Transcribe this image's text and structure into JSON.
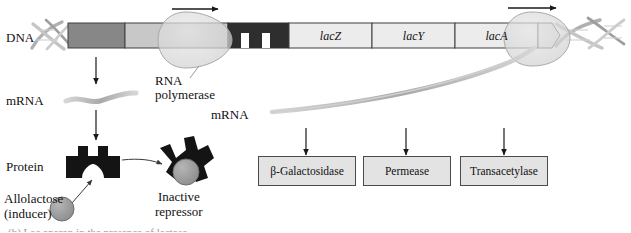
{
  "figure": {
    "partial_caption": "(b) Lac operon in the presence of lactose"
  },
  "row_labels": {
    "dna": "DNA",
    "mrna_left": "mRNA",
    "mrna_right": "mRNA",
    "protein": "Protein"
  },
  "dna_segments": [
    {
      "id": "regulatory-gene",
      "label": "",
      "color": "#878787"
    },
    {
      "id": "promoter-i",
      "label": "",
      "color": "#c8c8c8"
    },
    {
      "id": "promoter-lac",
      "label": "",
      "color": "#2e2e2e"
    },
    {
      "id": "gene-lacz",
      "label": "lacZ",
      "color": "#ececec"
    },
    {
      "id": "gene-lacy",
      "label": "lacY",
      "color": "#ececec"
    },
    {
      "id": "gene-laca",
      "label": "lacA",
      "color": "#ececec"
    }
  ],
  "annotations": {
    "rna_polymerase": "RNA\npolymerase",
    "rna_polymerase_line1": "RNA",
    "rna_polymerase_line2": "polymerase",
    "inactive_repressor_line1": "Inactive",
    "inactive_repressor_line2": "repressor",
    "allolactose_line1": "Allolactose",
    "allolactose_line2": "(inducer)"
  },
  "protein_products": [
    {
      "name": "beta-galactosidase",
      "label": "β-Galactosidase"
    },
    {
      "name": "permease",
      "label": "Permease"
    },
    {
      "name": "transacetylase",
      "label": "Transacetylase"
    }
  ],
  "colors": {
    "dna_dark_gray": "#878787",
    "dna_light_gray": "#c8c8c8",
    "operator_black": "#2e2e2e",
    "gene_box": "#ececec",
    "polymerase_fill": "#d8d8d8",
    "protein_black": "#141414",
    "allolactose_fill": "#9c9c9c",
    "product_box_fill": "#e3e3e3",
    "outline": "#4a4a4a",
    "arrow": "#1a1a1a",
    "helix": "#b3b3b3",
    "mrna": "#bdbdbd"
  }
}
